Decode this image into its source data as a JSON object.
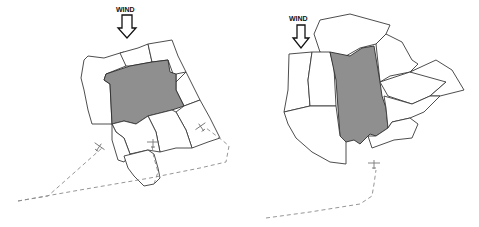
{
  "colors": {
    "target_plot_fill": "#8f8f8f",
    "plot_stroke": "#3a3a3a",
    "flight_path": "#8a8a8a",
    "arrow": "#111111"
  },
  "diagrams": [
    {
      "id": "left",
      "wind": {
        "label": "WIND",
        "label_x": 116,
        "label_y": 12,
        "arrow": "M122,15 L132,15 L132,28 L136,28 L127,38 L118,28 L122,28 Z"
      },
      "plots": [
        {
          "name": "plot-northwest",
          "target": false,
          "d": "M84,60 L88,56 L104,58 L120,53 L124,52 L126,66 L106,74 L104,80 L110,84 L112,124 L92,124 L88,110 L84,90 L81,78 Z"
        },
        {
          "name": "plot-north",
          "target": false,
          "d": "M120,53 L138,48 L148,44 L152,62 L130,66 L126,66 Z"
        },
        {
          "name": "plot-northeast",
          "target": false,
          "d": "M148,44 L172,40 L178,56 L186,72 L176,74 L176,82 L168,60 L152,62 Z"
        },
        {
          "name": "plot-east",
          "target": false,
          "d": "M176,82 L186,72 L192,84 L200,100 L184,106 L176,90 Z"
        },
        {
          "name": "plot-target",
          "target": true,
          "d": "M106,74 L130,66 L152,62 L168,60 L170,72 L176,74 L176,90 L184,106 L172,110 L148,116 L136,124 L124,121 L112,124 L110,84 L104,80 Z"
        },
        {
          "name": "plot-far-east",
          "target": false,
          "d": "M184,106 L200,100 L210,118 L220,138 L208,142 L192,148 L186,130 L176,112 Z"
        },
        {
          "name": "plot-southeast",
          "target": false,
          "d": "M148,116 L172,110 L176,112 L186,130 L192,148 L176,148 L160,152 L156,132 Z"
        },
        {
          "name": "plot-south-center",
          "target": false,
          "d": "M112,124 L124,121 L136,124 L148,116 L156,132 L160,152 L148,150 L130,154 L124,138 L116,132 Z"
        },
        {
          "name": "plot-southwest",
          "target": false,
          "d": "M112,124 L116,132 L124,138 L130,154 L124,162 L118,160 L112,140 Z"
        },
        {
          "name": "plot-south-tip",
          "target": false,
          "d": "M124,156 L148,150 L154,154 L158,168 L160,178 L154,184 L144,186 L134,176 L128,168 Z"
        }
      ],
      "flight_paths": [
        "M18,201 L48,196 L102,148",
        "M18,201 L80,190 L150,178 L200,168 L226,162 L229,146 L222,140 L206,128",
        "M154,184 L158,172 L154,158 L152,146"
      ],
      "planes": [
        {
          "x": 99,
          "y": 147,
          "rotate": 35
        },
        {
          "x": 153,
          "y": 143,
          "rotate": 0
        },
        {
          "x": 201,
          "y": 127,
          "rotate": -35
        }
      ]
    },
    {
      "id": "right",
      "wind": {
        "label": "WIND",
        "label_x": 289,
        "label_y": 21,
        "arrow": "M297,25 L305,25 L305,38 L309,38 L301,48 L293,38 L297,38 Z"
      },
      "plots": [
        {
          "name": "plot-north",
          "target": false,
          "d": "M314,34 L320,20 L350,14 L390,25 L386,34 L376,44 L360,48 L346,56 L336,58 L320,52 Z"
        },
        {
          "name": "plot-northeast",
          "target": false,
          "d": "M386,34 L402,42 L412,60 L418,64 L410,72 L390,76 L380,82 L376,44 Z"
        },
        {
          "name": "plot-west",
          "target": false,
          "d": "M289,54 L312,52 L308,80 L310,106 L284,112 L288,90 Z"
        },
        {
          "name": "plot-west-center",
          "target": false,
          "d": "M312,52 L330,52 L334,68 L336,106 L310,106 L308,80 Z"
        },
        {
          "name": "plot-target",
          "target": true,
          "d": "M330,52 L350,56 L362,48 L374,46 L378,70 L380,82 L382,96 L386,108 L388,128 L376,136 L370,134 L360,144 L354,140 L346,142 L340,136 L338,108 L336,80 Z"
        },
        {
          "name": "plot-east",
          "target": false,
          "d": "M380,82 L410,72 L426,66 L446,82 L430,96 L412,104 L388,96 Z"
        },
        {
          "name": "plot-far-east",
          "target": false,
          "d": "M410,72 L436,60 L452,70 L464,90 L440,96 L430,96 L446,82 Z"
        },
        {
          "name": "plot-southeast",
          "target": false,
          "d": "M384,96 L412,104 L430,96 L440,96 L424,112 L410,118 L392,122 L388,128 L386,108 Z"
        },
        {
          "name": "plot-south",
          "target": false,
          "d": "M388,128 L392,122 L410,118 L418,124 L412,138 L394,140 L372,148 L368,136 L376,136 Z"
        },
        {
          "name": "plot-southwest",
          "target": false,
          "d": "M284,112 L310,106 L336,106 L340,136 L346,142 L346,164 L330,162 L312,152 L296,138 L288,124 Z"
        }
      ],
      "flight_paths": [
        "M266,218 L310,212 L360,204 L372,196 L374,184 L376,170"
      ],
      "planes": [
        {
          "x": 374,
          "y": 164,
          "rotate": 0
        }
      ]
    }
  ]
}
